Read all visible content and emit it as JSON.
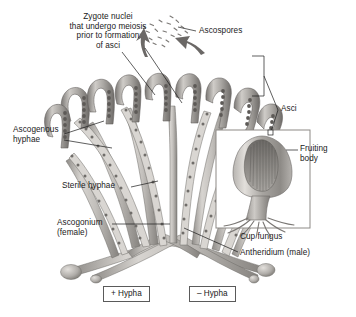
{
  "figure": {
    "background_color": "#ffffff",
    "ink_color": "#1a1a1a",
    "hyphae_fill": "#b9b6b2",
    "hyphae_dark": "#6f6c69",
    "hyphae_light": "#dedbd7",
    "inset_border_color": "#8d8a86",
    "arrow_color": "#6b6866"
  },
  "labels": {
    "zygote_nuclei": {
      "line1": "Zygote nuclei",
      "line2": "that undergo meiosis",
      "line3": "prior to formation",
      "line4": "of asci"
    },
    "ascospores": "Ascospores",
    "asci": "Asci",
    "fruiting_body": {
      "line1": "Fruiting",
      "line2": "body"
    },
    "ascogenous_hyphae": {
      "line1": "Ascogenous",
      "line2": "hyphae"
    },
    "sterile_hyphae": "Sterile hyphae",
    "ascogonium": {
      "line1": "Ascogonium",
      "line2": "(female)"
    },
    "antheridium": "Antheridium (male)",
    "cup_fungus": "Cup fungus",
    "plus_hypha": "+ Hypha",
    "minus_hypha": "– Hypha"
  }
}
